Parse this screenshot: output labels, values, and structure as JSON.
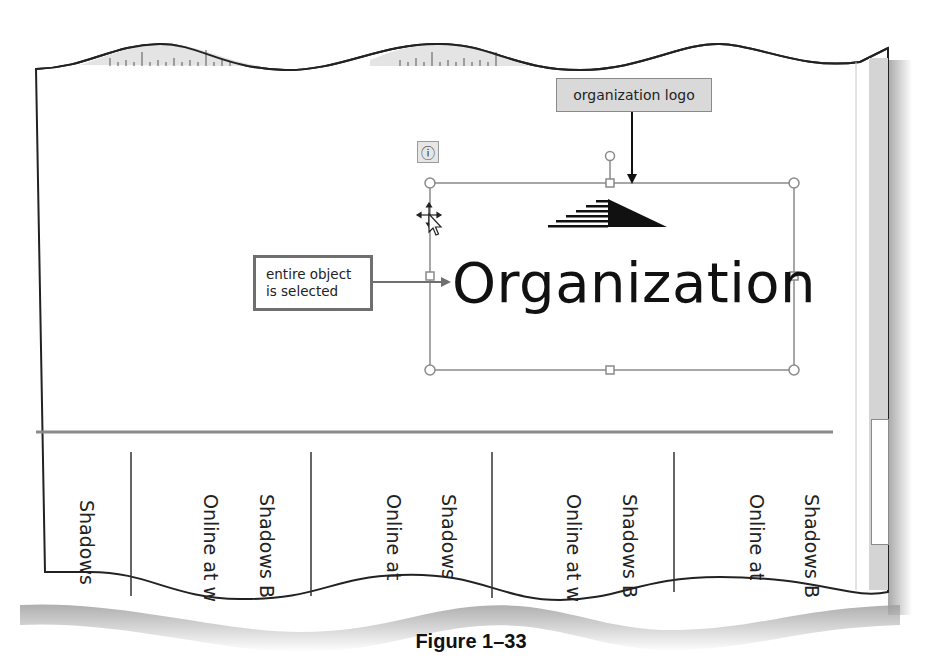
{
  "document": {
    "logo_text": "Organization",
    "tear_offs": [
      {
        "lines": [
          "Shadows"
        ]
      },
      {
        "lines": [
          "Shadows B",
          "Online at w"
        ]
      },
      {
        "lines": [
          "Shadows",
          "Online at"
        ]
      },
      {
        "lines": [
          "Shadows B",
          "Online at w"
        ]
      },
      {
        "lines": [
          "Shadows B",
          "Online at"
        ]
      }
    ]
  },
  "callouts": {
    "organization_logo": "organization logo",
    "entire_object_line1": "entire object",
    "entire_object_line2": "is selected"
  },
  "ui": {
    "info_button_glyph": "ⓘ",
    "move_cursor": "move-pointer"
  },
  "caption": "Figure 1–33",
  "colors": {
    "callout_fill": "#d9d9d9",
    "callout_border": "#6f6f6f",
    "selection_border": "#8a8a8a",
    "scrollbar_track": "#d4d4d4",
    "ruler": "#e4e4e4"
  }
}
